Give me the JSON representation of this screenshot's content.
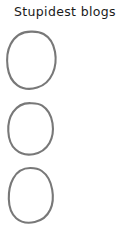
{
  "page": {
    "title": "Stupidest blogs",
    "background_color": "#ffffff",
    "width": 139,
    "height": 236
  },
  "style": {
    "title_color": "#1a1a1a",
    "stroke_color": "#787878"
  },
  "checklist": {
    "items": [
      {
        "marker": "hand-drawn-circle",
        "label": "",
        "checked": false
      },
      {
        "marker": "hand-drawn-circle",
        "label": "",
        "checked": false
      },
      {
        "marker": "hand-drawn-circle",
        "label": "",
        "checked": false
      }
    ]
  }
}
